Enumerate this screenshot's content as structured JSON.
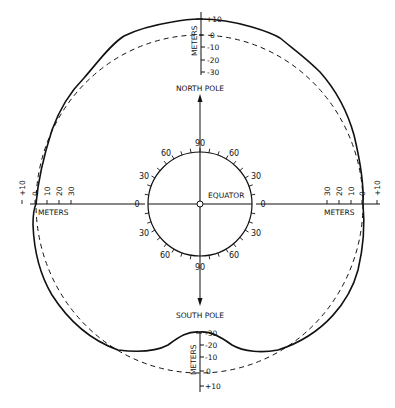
{
  "diagram": {
    "labels": {
      "north_pole": "NORTH POLE",
      "south_pole": "SOUTH POLE",
      "equator": "EQUATOR",
      "meters": "METERS"
    },
    "inner_globe": {
      "latitudes_top": [
        "90",
        "60",
        "60",
        "30",
        "30"
      ],
      "lat_90_top": "90",
      "lat_90_bottom": "90",
      "lat_60_ul": "60",
      "lat_60_ur": "60",
      "lat_30_ul": "30",
      "lat_30_ur": "30",
      "lat_0_left": "0",
      "lat_0_right": "0",
      "lat_30_ll": "30",
      "lat_30_lr": "30",
      "lat_60_ll": "60",
      "lat_60_lr": "60"
    },
    "scale_top": [
      "+10",
      "0",
      "-10",
      "-20",
      "-30"
    ],
    "scale_bottom": [
      "-30",
      "-20",
      "-10",
      "0",
      "+10"
    ],
    "scale_left": [
      "+10",
      "0",
      "10",
      "20",
      "30"
    ],
    "scale_right": [
      "30",
      "20",
      "10",
      "0",
      "+10"
    ],
    "legend": {
      "solid_line": "geoid (actual shape)",
      "dashed_line": "reference ellipsoid"
    }
  }
}
